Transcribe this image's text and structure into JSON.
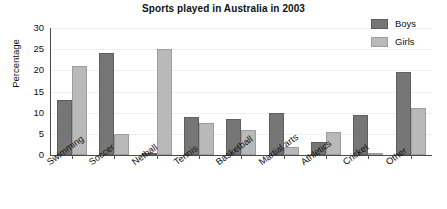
{
  "chart_data": {
    "type": "bar",
    "title": "Sports played in Australia in 2003",
    "xlabel": "",
    "ylabel": "Percentage",
    "ylim": [
      0,
      30
    ],
    "yticks": [
      0,
      5,
      10,
      15,
      20,
      25,
      30
    ],
    "grid": true,
    "legend_position": "top-right",
    "categories": [
      "Swimming",
      "Soccer",
      "Netball",
      "Tennis",
      "Basketball",
      "Martial arts",
      "Athletics",
      "Cricket",
      "Other"
    ],
    "series": [
      {
        "name": "Boys",
        "color": "#767676",
        "values": [
          13,
          24,
          0.3,
          9,
          8.5,
          10,
          3,
          9.5,
          19.5
        ]
      },
      {
        "name": "Girls",
        "color": "#b9b9b9",
        "values": [
          21,
          5,
          25,
          7.5,
          6,
          2,
          5.5,
          0.3,
          11
        ]
      }
    ]
  }
}
